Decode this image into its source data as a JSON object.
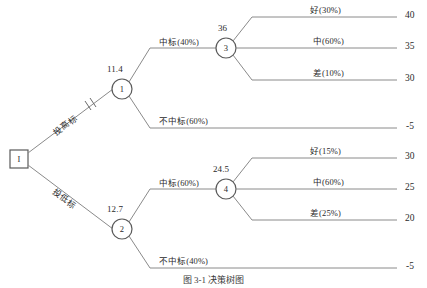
{
  "diagram": {
    "title": "决策树",
    "caption": "图 3-1  决策树图",
    "root": {
      "id": "root-node",
      "symbol": "I",
      "shape": "square"
    },
    "decision_branches": [
      {
        "name": "high-bid",
        "label": "投高标",
        "pruned": true,
        "prune_mark": "‖"
      },
      {
        "name": "low-bid",
        "label": "投低标",
        "pruned": false,
        "prune_mark": ""
      }
    ],
    "chance_nodes": [
      {
        "id": "1",
        "value": "11.4"
      },
      {
        "id": "2",
        "value": "12.7"
      },
      {
        "id": "3",
        "value": "36"
      },
      {
        "id": "4",
        "value": "24.5"
      }
    ],
    "bid_outcomes": [
      {
        "node": "1",
        "win_label": "中标(40%)",
        "lose_label": "不中标(60%)"
      },
      {
        "node": "2",
        "win_label": "中标(60%)",
        "lose_label": "不中标(40%)"
      }
    ],
    "quality_outcomes_upper": [
      {
        "label": "好(30%)",
        "payoff": "40"
      },
      {
        "label": "中(60%)",
        "payoff": "35"
      },
      {
        "label": "差(10%)",
        "payoff": "30"
      }
    ],
    "quality_outcomes_lower": [
      {
        "label": "好(15%)",
        "payoff": "30"
      },
      {
        "label": "中(60%)",
        "payoff": "25"
      },
      {
        "label": "差(25%)",
        "payoff": "20"
      }
    ],
    "lose_payoffs": [
      {
        "branch": "upper",
        "payoff": "-5"
      },
      {
        "branch": "lower",
        "payoff": "-5"
      }
    ],
    "colors": {
      "line": "#8a8a8a",
      "node_stroke": "#5a5a5a",
      "text": "#2b2b2b",
      "background": "#ffffff"
    }
  }
}
